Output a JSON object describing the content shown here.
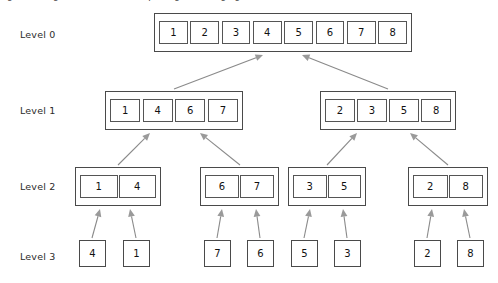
{
  "caption": "Figure : Merge sort — recursive splitting and merging",
  "colors": {
    "box_border": "#4a4a4a",
    "cell_border": "#555555",
    "arrow": "#8a8a8a",
    "text": "#111111",
    "background": "#ffffff"
  },
  "levels": [
    {
      "label": "Level 0",
      "label_x": 20,
      "label_y": 29,
      "groups": [
        {
          "x": 154,
          "y": 13,
          "w": 258,
          "h": 39,
          "values": [
            "1",
            "2",
            "3",
            "4",
            "5",
            "6",
            "7",
            "8"
          ]
        }
      ]
    },
    {
      "label": "Level 1",
      "label_x": 20,
      "label_y": 105,
      "groups": [
        {
          "x": 105,
          "y": 91,
          "w": 138,
          "h": 39,
          "values": [
            "1",
            "4",
            "6",
            "7"
          ]
        },
        {
          "x": 320,
          "y": 91,
          "w": 136,
          "h": 39,
          "values": [
            "2",
            "3",
            "5",
            "8"
          ]
        }
      ]
    },
    {
      "label": "Level 2",
      "label_x": 20,
      "label_y": 181,
      "groups": [
        {
          "x": 75,
          "y": 167,
          "w": 86,
          "h": 39,
          "values": [
            "1",
            "4"
          ]
        },
        {
          "x": 200,
          "y": 167,
          "w": 79,
          "h": 39,
          "values": [
            "6",
            "7"
          ]
        },
        {
          "x": 288,
          "y": 167,
          "w": 78,
          "h": 39,
          "values": [
            "3",
            "5"
          ]
        },
        {
          "x": 408,
          "y": 167,
          "w": 80,
          "h": 39,
          "values": [
            "2",
            "8"
          ]
        }
      ]
    },
    {
      "label": "Level 3",
      "label_x": 20,
      "label_y": 251,
      "leaves": [
        {
          "x": 79,
          "y": 240,
          "w": 27,
          "h": 27,
          "value": "4"
        },
        {
          "x": 123,
          "y": 240,
          "w": 27,
          "h": 27,
          "value": "1"
        },
        {
          "x": 204,
          "y": 240,
          "w": 27,
          "h": 27,
          "value": "7"
        },
        {
          "x": 247,
          "y": 240,
          "w": 27,
          "h": 27,
          "value": "6"
        },
        {
          "x": 291,
          "y": 240,
          "w": 27,
          "h": 27,
          "value": "5"
        },
        {
          "x": 334,
          "y": 240,
          "w": 27,
          "h": 27,
          "value": "3"
        },
        {
          "x": 414,
          "y": 240,
          "w": 27,
          "h": 27,
          "value": "2"
        },
        {
          "x": 457,
          "y": 240,
          "w": 27,
          "h": 27,
          "value": "8"
        }
      ]
    }
  ],
  "arrows": [
    {
      "name": "arrow-l1-left-to-l0",
      "x1": 174,
      "y1": 89,
      "x2": 263,
      "y2": 55
    },
    {
      "name": "arrow-l1-right-to-l0",
      "x1": 388,
      "y1": 89,
      "x2": 302,
      "y2": 55
    },
    {
      "name": "arrow-l2-g1-to-l1-left",
      "x1": 118,
      "y1": 165,
      "x2": 150,
      "y2": 133
    },
    {
      "name": "arrow-l2-g2-to-l1-left",
      "x1": 240,
      "y1": 165,
      "x2": 200,
      "y2": 133
    },
    {
      "name": "arrow-l2-g3-to-l1-right",
      "x1": 327,
      "y1": 165,
      "x2": 357,
      "y2": 133
    },
    {
      "name": "arrow-l2-g4-to-l1-right",
      "x1": 448,
      "y1": 165,
      "x2": 410,
      "y2": 133
    },
    {
      "name": "arrow-leaf-4-to-l2-g1",
      "x1": 92,
      "y1": 238,
      "x2": 100,
      "y2": 209
    },
    {
      "name": "arrow-leaf-1-to-l2-g1",
      "x1": 136,
      "y1": 238,
      "x2": 130,
      "y2": 209
    },
    {
      "name": "arrow-leaf-7-to-l2-g2",
      "x1": 217,
      "y1": 238,
      "x2": 222,
      "y2": 209
    },
    {
      "name": "arrow-leaf-6-to-l2-g2",
      "x1": 260,
      "y1": 238,
      "x2": 256,
      "y2": 209
    },
    {
      "name": "arrow-leaf-5-to-l2-g3",
      "x1": 304,
      "y1": 238,
      "x2": 310,
      "y2": 209
    },
    {
      "name": "arrow-leaf-3-to-l2-g3",
      "x1": 347,
      "y1": 238,
      "x2": 343,
      "y2": 209
    },
    {
      "name": "arrow-leaf-2-to-l2-g4",
      "x1": 427,
      "y1": 238,
      "x2": 432,
      "y2": 209
    },
    {
      "name": "arrow-leaf-8-to-l2-g4",
      "x1": 470,
      "y1": 238,
      "x2": 464,
      "y2": 209
    }
  ]
}
